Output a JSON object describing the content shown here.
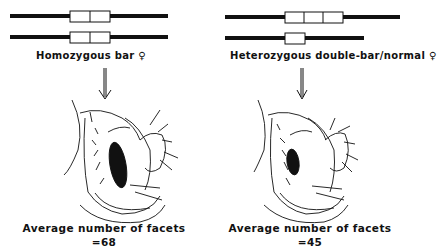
{
  "panels": [
    {
      "id": "homozygous",
      "title": "Homozygous bar ♀",
      "chromosomes": [
        {
          "segments": 2
        },
        {
          "segments": 2
        }
      ],
      "result_label": "Average number of facets",
      "result_value": "=68"
    },
    {
      "id": "heterozygous",
      "title": "Heterozygous double-bar/normal ♀",
      "chromosomes": [
        {
          "segments": 3
        },
        {
          "segments": 1
        }
      ],
      "result_label": "Average number of facets",
      "result_value": "=45"
    }
  ],
  "colors": {
    "ink": "#111111",
    "background": "#ffffff"
  }
}
